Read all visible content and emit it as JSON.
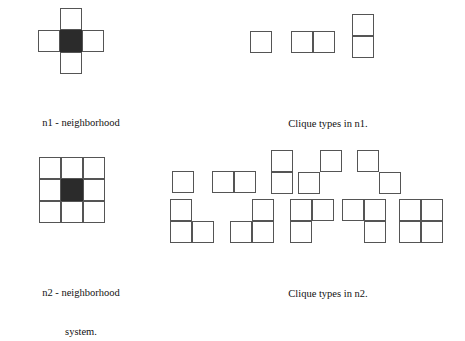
{
  "figure": {
    "background_color": "#ffffff",
    "stroke_color": "#555555",
    "fill_color": "#2b2b2b",
    "cell_size_px": 22
  },
  "captions": {
    "n1_neighborhood_line1": "n1 - neighborhood",
    "n1_neighborhood_line2": "system.",
    "n1_cliques": "Clique types in n1.",
    "n2_neighborhood_line1": "n2 - neighborhood",
    "n2_neighborhood_line2": "system.",
    "n2_cliques": "Clique types in n2."
  },
  "shapes": {
    "n1_neighborhood": {
      "name": "n1-neighborhood-plus",
      "cols": 3,
      "rows": 3,
      "cells": [
        {
          "c": 1,
          "r": 0,
          "filled": false
        },
        {
          "c": 0,
          "r": 1,
          "filled": false
        },
        {
          "c": 1,
          "r": 1,
          "filled": true
        },
        {
          "c": 2,
          "r": 1,
          "filled": false
        },
        {
          "c": 1,
          "r": 2,
          "filled": false
        }
      ]
    },
    "n2_neighborhood": {
      "name": "n2-neighborhood-3x3",
      "cols": 3,
      "rows": 3,
      "cells": [
        {
          "c": 0,
          "r": 0,
          "filled": false
        },
        {
          "c": 1,
          "r": 0,
          "filled": false
        },
        {
          "c": 2,
          "r": 0,
          "filled": false
        },
        {
          "c": 0,
          "r": 1,
          "filled": false
        },
        {
          "c": 1,
          "r": 1,
          "filled": true
        },
        {
          "c": 2,
          "r": 1,
          "filled": false
        },
        {
          "c": 0,
          "r": 2,
          "filled": false
        },
        {
          "c": 1,
          "r": 2,
          "filled": false
        },
        {
          "c": 2,
          "r": 2,
          "filled": false
        }
      ]
    },
    "n1_cliques": [
      {
        "name": "single-cell",
        "cols": 1,
        "rows": 1,
        "cells": [
          {
            "c": 0,
            "r": 0,
            "filled": false
          }
        ]
      },
      {
        "name": "horizontal-pair",
        "cols": 2,
        "rows": 1,
        "cells": [
          {
            "c": 0,
            "r": 0,
            "filled": false
          },
          {
            "c": 1,
            "r": 0,
            "filled": false
          }
        ]
      },
      {
        "name": "vertical-pair",
        "cols": 1,
        "rows": 2,
        "cells": [
          {
            "c": 0,
            "r": 0,
            "filled": false
          },
          {
            "c": 0,
            "r": 1,
            "filled": false
          }
        ]
      }
    ],
    "n2_cliques_row1": [
      {
        "name": "single-cell",
        "cols": 1,
        "rows": 1,
        "cells": [
          {
            "c": 0,
            "r": 0,
            "filled": false
          }
        ]
      },
      {
        "name": "horizontal-pair",
        "cols": 2,
        "rows": 1,
        "cells": [
          {
            "c": 0,
            "r": 0,
            "filled": false
          },
          {
            "c": 1,
            "r": 0,
            "filled": false
          }
        ]
      },
      {
        "name": "vertical-pair",
        "cols": 1,
        "rows": 2,
        "cells": [
          {
            "c": 0,
            "r": 0,
            "filled": false
          },
          {
            "c": 0,
            "r": 1,
            "filled": false
          }
        ]
      },
      {
        "name": "anti-diagonal-pair",
        "cols": 2,
        "rows": 2,
        "cells": [
          {
            "c": 1,
            "r": 0,
            "filled": false
          },
          {
            "c": 0,
            "r": 1,
            "filled": false
          }
        ]
      },
      {
        "name": "main-diagonal-pair",
        "cols": 2,
        "rows": 2,
        "cells": [
          {
            "c": 0,
            "r": 0,
            "filled": false
          },
          {
            "c": 1,
            "r": 1,
            "filled": false
          }
        ]
      }
    ],
    "n2_cliques_row2": [
      {
        "name": "triomino-top-left-bottom-left-bottom-right",
        "cols": 2,
        "rows": 2,
        "cells": [
          {
            "c": 0,
            "r": 0,
            "filled": false
          },
          {
            "c": 0,
            "r": 1,
            "filled": false
          },
          {
            "c": 1,
            "r": 1,
            "filled": false
          }
        ]
      },
      {
        "name": "triomino-top-right-bottom-left-bottom-right",
        "cols": 2,
        "rows": 2,
        "cells": [
          {
            "c": 1,
            "r": 0,
            "filled": false
          },
          {
            "c": 0,
            "r": 1,
            "filled": false
          },
          {
            "c": 1,
            "r": 1,
            "filled": false
          }
        ]
      },
      {
        "name": "triomino-top-left-top-right-bottom-left",
        "cols": 2,
        "rows": 2,
        "cells": [
          {
            "c": 0,
            "r": 0,
            "filled": false
          },
          {
            "c": 1,
            "r": 0,
            "filled": false
          },
          {
            "c": 0,
            "r": 1,
            "filled": false
          }
        ]
      },
      {
        "name": "triomino-top-left-top-right-bottom-right",
        "cols": 2,
        "rows": 2,
        "cells": [
          {
            "c": 0,
            "r": 0,
            "filled": false
          },
          {
            "c": 1,
            "r": 0,
            "filled": false
          },
          {
            "c": 1,
            "r": 1,
            "filled": false
          }
        ]
      },
      {
        "name": "square-2x2",
        "cols": 2,
        "rows": 2,
        "cells": [
          {
            "c": 0,
            "r": 0,
            "filled": false
          },
          {
            "c": 1,
            "r": 0,
            "filled": false
          },
          {
            "c": 0,
            "r": 1,
            "filled": false
          },
          {
            "c": 1,
            "r": 1,
            "filled": false
          }
        ]
      }
    ]
  },
  "layout": {
    "n1_neighborhood_pos": {
      "x": 38,
      "y": 8
    },
    "n1_caption_pos": {
      "x": 6,
      "y": 90,
      "width": 150
    },
    "n1_cliques_pos": [
      {
        "x": 250,
        "y": 31
      },
      {
        "x": 291,
        "y": 31
      },
      {
        "x": 352,
        "y": 14
      }
    ],
    "n1_cliques_caption_pos": {
      "x": 258,
      "y": 91,
      "width": 140
    },
    "n2_neighborhood_pos": {
      "x": 39,
      "y": 157
    },
    "n2_caption_pos": {
      "x": 6,
      "y": 260,
      "width": 150
    },
    "n2_cliques_row1_pos": [
      {
        "x": 172,
        "y": 171
      },
      {
        "x": 212,
        "y": 171
      },
      {
        "x": 271,
        "y": 150
      },
      {
        "x": 298,
        "y": 150
      },
      {
        "x": 357,
        "y": 150
      }
    ],
    "n2_cliques_row2_pos": [
      {
        "x": 170,
        "y": 199
      },
      {
        "x": 230,
        "y": 199
      },
      {
        "x": 290,
        "y": 199
      },
      {
        "x": 342,
        "y": 199
      },
      {
        "x": 399,
        "y": 199
      }
    ],
    "n2_cliques_caption_pos": {
      "x": 258,
      "y": 261,
      "width": 140
    }
  }
}
